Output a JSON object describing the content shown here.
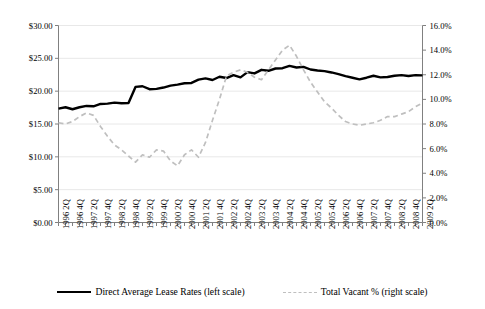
{
  "chart_data": {
    "type": "line",
    "title": "",
    "subtitle": "",
    "xlabel": "",
    "ylabel": "",
    "grid": true,
    "legend_position": "bottom",
    "axes": {
      "left": {
        "label": "",
        "ylim": [
          0,
          30
        ],
        "tick_step": 5,
        "tick_labels": [
          "$0.00",
          "$5.00",
          "$10.00",
          "$15.00",
          "$20.00",
          "$25.00",
          "$30.00"
        ],
        "tick_values": [
          0,
          5,
          10,
          15,
          20,
          25,
          30
        ]
      },
      "right": {
        "label": "",
        "ylim": [
          0,
          16
        ],
        "tick_step": 2,
        "tick_labels": [
          "0.0%",
          "2.0%",
          "4.0%",
          "6.0%",
          "8.0%",
          "10.0%",
          "12.0%",
          "14.0%",
          "16.0%"
        ],
        "tick_values": [
          0,
          2,
          4,
          6,
          8,
          10,
          12,
          14,
          16
        ]
      }
    },
    "x": [
      "1996 2Q",
      "1996 3Q",
      "1996 4Q",
      "1997 1Q",
      "1997 2Q",
      "1997 3Q",
      "1997 4Q",
      "1998 1Q",
      "1998 2Q",
      "1998 3Q",
      "1998 4Q",
      "1999 1Q",
      "1999 2Q",
      "1999 3Q",
      "1999 4Q",
      "2000 1Q",
      "2000 2Q",
      "2000 3Q",
      "2000 4Q",
      "2001 1Q",
      "2001 2Q",
      "2001 3Q",
      "2001 4Q",
      "2002 1Q",
      "2002 2Q",
      "2002 3Q",
      "2002 4Q",
      "2003 1Q",
      "2003 2Q",
      "2003 3Q",
      "2003 4Q",
      "2004 1Q",
      "2004 2Q",
      "2004 3Q",
      "2004 4Q",
      "2005 1Q",
      "2005 2Q",
      "2005 3Q",
      "2005 4Q",
      "2006 1Q",
      "2006 2Q",
      "2006 3Q",
      "2006 4Q",
      "2007 1Q",
      "2007 2Q",
      "2007 3Q",
      "2007 4Q",
      "2008 1Q",
      "2008 2Q",
      "2008 3Q",
      "2008 4Q",
      "2009 1Q",
      "2009 2Q"
    ],
    "xtick_labels": [
      "1996 2Q",
      "1996 4Q",
      "1997 2Q",
      "1997 4Q",
      "1998 2Q",
      "1998 4Q",
      "1999 2Q",
      "1999 4Q",
      "2000 2Q",
      "2000 4Q",
      "2001 2Q",
      "2001 4Q",
      "2002 2Q",
      "2002 4Q",
      "2003 2Q",
      "2003 4Q",
      "2004 2Q",
      "2004 4Q",
      "2005 2Q",
      "2005 4Q",
      "2006 2Q",
      "2006 4Q",
      "2007 2Q",
      "2007 4Q",
      "2008 2Q",
      "2008 4Q",
      "2009 2Q"
    ],
    "series": [
      {
        "name": "Direct Average Lease Rates (left scale)",
        "axis": "left",
        "style": "solid",
        "color": "#000000",
        "width": 2.4,
        "unit": "$",
        "values": [
          17.35,
          17.55,
          17.25,
          17.55,
          17.75,
          17.7,
          18.05,
          18.1,
          18.25,
          18.15,
          18.2,
          20.65,
          20.75,
          20.3,
          20.35,
          20.55,
          20.85,
          21.0,
          21.2,
          21.25,
          21.75,
          21.95,
          21.7,
          22.2,
          22.0,
          22.45,
          22.1,
          22.9,
          22.7,
          23.25,
          23.1,
          23.45,
          23.5,
          23.85,
          23.6,
          23.7,
          23.3,
          23.15,
          23.05,
          22.85,
          22.6,
          22.3,
          22.05,
          21.8,
          22.05,
          22.35,
          22.1,
          22.15,
          22.35,
          22.45,
          22.3,
          22.45,
          22.4
        ]
      },
      {
        "name": "Total Vacant % (right scale)",
        "axis": "right",
        "style": "dashed",
        "color": "#bfbfbf",
        "width": 1.7,
        "unit": "%",
        "values": [
          8.1,
          8.0,
          8.2,
          8.6,
          8.9,
          8.7,
          7.8,
          7.0,
          6.3,
          5.9,
          5.4,
          4.9,
          5.5,
          5.3,
          5.9,
          5.8,
          5.0,
          4.6,
          5.5,
          5.9,
          5.3,
          6.5,
          8.3,
          10.0,
          11.9,
          12.2,
          12.4,
          12.2,
          11.8,
          11.6,
          12.4,
          13.2,
          14.0,
          14.4,
          13.5,
          12.4,
          11.4,
          10.6,
          9.8,
          9.3,
          8.7,
          8.2,
          8.0,
          7.9,
          8.0,
          8.1,
          8.3,
          8.6,
          8.6,
          8.8,
          9.0,
          9.4,
          9.7
        ]
      }
    ]
  },
  "legend": {
    "entries": [
      {
        "label": "Direct Average Lease Rates (left scale)",
        "style": "solid",
        "swatch": "solid-line-swatch"
      },
      {
        "label": "Total Vacant % (right scale)",
        "style": "dashed",
        "swatch": "dashed-line-swatch"
      }
    ]
  },
  "colors": {
    "series_lease": "#000000",
    "series_vacancy": "#bfbfbf",
    "grid": "#e8e8e8",
    "axis": "#808080",
    "background": "#ffffff"
  }
}
